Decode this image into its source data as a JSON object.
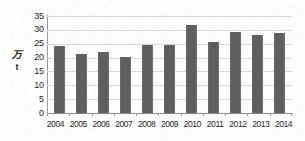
{
  "chart_data": {
    "type": "bar",
    "title": "",
    "subtitle": "",
    "xlabel": "",
    "ylabel": "万t",
    "ylabel_lines": [
      "万",
      "t"
    ],
    "categories": [
      "2004",
      "2005",
      "2006",
      "2007",
      "2008",
      "2009",
      "2010",
      "2011",
      "2012",
      "2013",
      "2014"
    ],
    "values": [
      24.3,
      21.2,
      22.1,
      20.2,
      24.4,
      24.5,
      31.6,
      25.5,
      29.4,
      28.1,
      29.0
    ],
    "ylim": [
      0,
      35
    ],
    "ytick_values": [
      0,
      5,
      10,
      15,
      20,
      25,
      30,
      35
    ],
    "ytick_labels": [
      "0",
      "5",
      "10",
      "15",
      "20",
      "25",
      "30",
      "35"
    ],
    "grid": true,
    "grid_axis": "y",
    "legend": false,
    "legend_position": "none",
    "bar_color": "#5f5f5f",
    "grid_color": "#d8d8d8",
    "axis_color": "#8c8c8c",
    "background_color": "#fdfdfd",
    "series": [
      {
        "name": "",
        "values": [
          24.3,
          21.2,
          22.1,
          20.2,
          24.4,
          24.5,
          31.6,
          25.5,
          29.4,
          28.1,
          29.0
        ]
      }
    ]
  }
}
